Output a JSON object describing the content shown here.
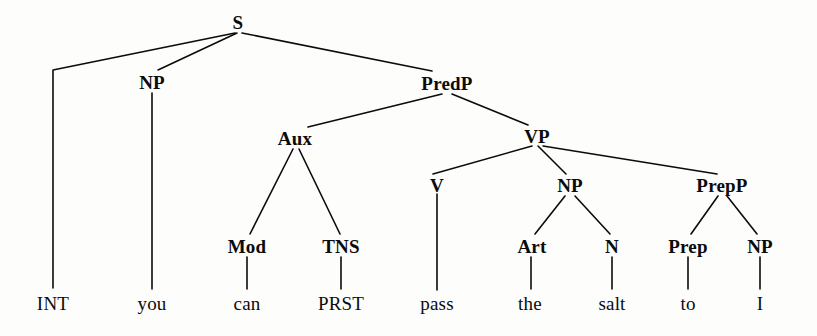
{
  "diagram": {
    "type": "syntax-tree",
    "sentence": "INT you can PRST pass the salt to I",
    "background_color": "#fdfdfb",
    "ink_color": "#0b0b0b",
    "width": 817,
    "height": 336,
    "nodes": [
      {
        "id": "s",
        "label": "S",
        "kind": "nonterminal",
        "x": 238,
        "y": 22
      },
      {
        "id": "np_subj",
        "label": "NP",
        "kind": "nonterminal",
        "x": 152,
        "y": 82
      },
      {
        "id": "predp",
        "label": "PredP",
        "kind": "nonterminal",
        "x": 447,
        "y": 83
      },
      {
        "id": "aux",
        "label": "Aux",
        "kind": "nonterminal",
        "x": 295,
        "y": 138
      },
      {
        "id": "vp",
        "label": "VP",
        "kind": "nonterminal",
        "x": 537,
        "y": 136
      },
      {
        "id": "v",
        "label": "V",
        "kind": "nonterminal",
        "x": 437,
        "y": 185
      },
      {
        "id": "np_obj",
        "label": "NP",
        "kind": "nonterminal",
        "x": 570,
        "y": 185
      },
      {
        "id": "prepp",
        "label": "PrepP",
        "kind": "nonterminal",
        "x": 722,
        "y": 185
      },
      {
        "id": "mod",
        "label": "Mod",
        "kind": "nonterminal",
        "x": 247,
        "y": 246
      },
      {
        "id": "tns",
        "label": "TNS",
        "kind": "nonterminal",
        "x": 341,
        "y": 246
      },
      {
        "id": "art",
        "label": "Art",
        "kind": "nonterminal",
        "x": 532,
        "y": 246
      },
      {
        "id": "n",
        "label": "N",
        "kind": "nonterminal",
        "x": 612,
        "y": 246
      },
      {
        "id": "prep",
        "label": "Prep",
        "kind": "nonterminal",
        "x": 688,
        "y": 246
      },
      {
        "id": "np_pobj",
        "label": "NP",
        "kind": "nonterminal",
        "x": 760,
        "y": 246
      },
      {
        "id": "w_int",
        "label": "INT",
        "kind": "terminal",
        "x": 53,
        "y": 303
      },
      {
        "id": "w_you",
        "label": "you",
        "kind": "terminal",
        "x": 152,
        "y": 303
      },
      {
        "id": "w_can",
        "label": "can",
        "kind": "terminal",
        "x": 247,
        "y": 303
      },
      {
        "id": "w_prst",
        "label": "PRST",
        "kind": "terminal",
        "x": 341,
        "y": 303
      },
      {
        "id": "w_pass",
        "label": "pass",
        "kind": "terminal",
        "x": 437,
        "y": 303
      },
      {
        "id": "w_the",
        "label": "the",
        "kind": "terminal",
        "x": 530,
        "y": 303
      },
      {
        "id": "w_salt",
        "label": "salt",
        "kind": "terminal",
        "x": 612,
        "y": 303
      },
      {
        "id": "w_to",
        "label": "to",
        "kind": "terminal",
        "x": 688,
        "y": 303
      },
      {
        "id": "w_i",
        "label": "I",
        "kind": "terminal",
        "x": 760,
        "y": 303
      }
    ],
    "edges": [
      {
        "from": "s",
        "to": "int-elbow",
        "points": [
          [
            235,
            33
          ],
          [
            53,
            70
          ],
          [
            53,
            288
          ]
        ]
      },
      {
        "from": "s",
        "to": "np_subj",
        "points": [
          [
            237,
            33
          ],
          [
            158,
            70
          ]
        ]
      },
      {
        "from": "s",
        "to": "predp",
        "points": [
          [
            242,
            33
          ],
          [
            432,
            71
          ]
        ]
      },
      {
        "from": "np_subj",
        "to": "w_you",
        "points": [
          [
            152,
            93
          ],
          [
            152,
            289
          ]
        ]
      },
      {
        "from": "predp",
        "to": "aux",
        "points": [
          [
            442,
            94
          ],
          [
            308,
            127
          ]
        ]
      },
      {
        "from": "predp",
        "to": "vp",
        "points": [
          [
            452,
            94
          ],
          [
            528,
            125
          ]
        ]
      },
      {
        "from": "aux",
        "to": "mod",
        "points": [
          [
            293,
            149
          ],
          [
            250,
            234
          ]
        ]
      },
      {
        "from": "aux",
        "to": "tns",
        "points": [
          [
            299,
            149
          ],
          [
            340,
            234
          ]
        ]
      },
      {
        "from": "mod",
        "to": "w_can",
        "points": [
          [
            247,
            257
          ],
          [
            247,
            289
          ]
        ]
      },
      {
        "from": "tns",
        "to": "w_prst",
        "points": [
          [
            341,
            257
          ],
          [
            341,
            289
          ]
        ]
      },
      {
        "from": "vp",
        "to": "v",
        "points": [
          [
            532,
            146
          ],
          [
            433,
            174
          ]
        ]
      },
      {
        "from": "vp",
        "to": "np_obj",
        "points": [
          [
            538,
            146
          ],
          [
            566,
            174
          ]
        ]
      },
      {
        "from": "vp",
        "to": "prepp",
        "points": [
          [
            543,
            146
          ],
          [
            717,
            174
          ]
        ]
      },
      {
        "from": "v",
        "to": "w_pass",
        "points": [
          [
            437,
            194
          ],
          [
            437,
            290
          ]
        ]
      },
      {
        "from": "np_obj",
        "to": "art",
        "points": [
          [
            565,
            196
          ],
          [
            535,
            234
          ]
        ]
      },
      {
        "from": "np_obj",
        "to": "n",
        "points": [
          [
            575,
            196
          ],
          [
            610,
            234
          ]
        ]
      },
      {
        "from": "art",
        "to": "w_the",
        "points": [
          [
            531,
            257
          ],
          [
            531,
            289
          ]
        ]
      },
      {
        "from": "n",
        "to": "w_salt",
        "points": [
          [
            612,
            257
          ],
          [
            612,
            289
          ]
        ]
      },
      {
        "from": "prepp",
        "to": "prep",
        "points": [
          [
            718,
            196
          ],
          [
            691,
            234
          ]
        ]
      },
      {
        "from": "prepp",
        "to": "np_pobj",
        "points": [
          [
            727,
            196
          ],
          [
            757,
            234
          ]
        ]
      },
      {
        "from": "prep",
        "to": "w_to",
        "points": [
          [
            688,
            257
          ],
          [
            688,
            289
          ]
        ]
      },
      {
        "from": "np_pobj",
        "to": "w_i",
        "points": [
          [
            760,
            257
          ],
          [
            760,
            289
          ]
        ]
      }
    ]
  }
}
